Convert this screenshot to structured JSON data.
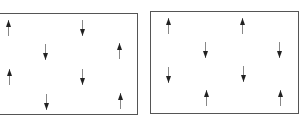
{
  "diagram": {
    "panels": [
      {
        "name": "left-panel",
        "box": {
          "x": -2,
          "y": 13,
          "w": 140,
          "h": 102
        },
        "arrows": [
          {
            "x": 8,
            "y": 28,
            "dir": "up"
          },
          {
            "x": 82,
            "y": 28,
            "dir": "down"
          },
          {
            "x": 45,
            "y": 52,
            "dir": "down"
          },
          {
            "x": 119,
            "y": 51,
            "dir": "up"
          },
          {
            "x": 9,
            "y": 77,
            "dir": "up"
          },
          {
            "x": 82,
            "y": 77,
            "dir": "down"
          },
          {
            "x": 46,
            "y": 102,
            "dir": "down"
          },
          {
            "x": 120,
            "y": 101,
            "dir": "up"
          }
        ]
      },
      {
        "name": "right-panel",
        "box": {
          "x": 150,
          "y": 11,
          "w": 149,
          "h": 103
        },
        "arrows": [
          {
            "x": 168,
            "y": 26,
            "dir": "up"
          },
          {
            "x": 242,
            "y": 26,
            "dir": "up"
          },
          {
            "x": 205,
            "y": 50,
            "dir": "down"
          },
          {
            "x": 279,
            "y": 50,
            "dir": "down"
          },
          {
            "x": 168,
            "y": 75,
            "dir": "down"
          },
          {
            "x": 243,
            "y": 74,
            "dir": "down"
          },
          {
            "x": 206,
            "y": 98,
            "dir": "up"
          },
          {
            "x": 280,
            "y": 98,
            "dir": "up"
          }
        ]
      }
    ],
    "colors": {
      "line": "#555555",
      "arrow": "#222222"
    }
  }
}
